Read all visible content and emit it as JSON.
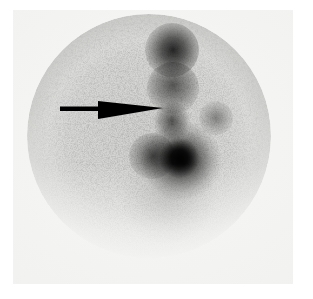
{
  "image": {
    "modality_label": "planar scintigram",
    "view_label": "anterior",
    "field_shape": "circular field of view",
    "background_color": "#f2f2f0",
    "film_border_color": "#ffffff",
    "tracer_color": "#111111"
  },
  "annotation": {
    "arrow": {
      "name": "pointer-arrow",
      "color": "#000000",
      "direction": "right",
      "tail_x": 47,
      "tail_y": 100,
      "tip_x": 150,
      "tip_y": 98,
      "head_base_x": 85,
      "head_half_height": 9
    }
  },
  "chart_data": {
    "type": "heatmap",
    "title": "",
    "xlabel": "",
    "ylabel": "",
    "grid": false,
    "legend": "",
    "colormap": "grayscale-inverted",
    "field_of_view": {
      "center_x": 136,
      "center_y": 126,
      "radius": 122
    },
    "regions": [
      {
        "name": "upper-focal-uptake",
        "center_x": 159,
        "center_y": 40,
        "radius": 27,
        "intensity": 0.92,
        "label": "focal tracer accumulation, upper midline"
      },
      {
        "name": "upper-chain-uptake",
        "center_x": 160,
        "center_y": 78,
        "radius": 26,
        "intensity": 0.72,
        "label": "linear chain of activity"
      },
      {
        "name": "mid-band-uptake",
        "center_x": 159,
        "center_y": 111,
        "radius": 23,
        "intensity": 0.72,
        "label": "mid vertical band of activity"
      },
      {
        "name": "lower-dominant-focus",
        "center_x": 170,
        "center_y": 149,
        "radius": 44,
        "intensity": 0.96,
        "label": "dominant intense focus of uptake"
      },
      {
        "name": "lower-focus-core",
        "center_x": 168,
        "center_y": 148,
        "radius": 22,
        "intensity": 0.97,
        "label": "hottest core"
      },
      {
        "name": "lateral-left-extension",
        "center_x": 139,
        "center_y": 146,
        "radius": 23,
        "intensity": 0.72,
        "label": "left lateral extension of focus"
      },
      {
        "name": "right-minor-uptake",
        "center_x": 203,
        "center_y": 108,
        "radius": 17,
        "intensity": 0.52,
        "label": "minor right-sided activity"
      },
      {
        "name": "diffuse-lower-background",
        "center_x": 155,
        "center_y": 198,
        "radius": 55,
        "intensity": 0.3,
        "label": "diffuse low-level background"
      },
      {
        "name": "rim-activity",
        "center_x": 136,
        "center_y": 130,
        "radius": 110,
        "intensity": 0.3,
        "label": "peripheral rim counts"
      }
    ],
    "intensity_scale": {
      "min": 0,
      "max": 1,
      "min_label": "low counts",
      "max_label": "high counts"
    }
  }
}
